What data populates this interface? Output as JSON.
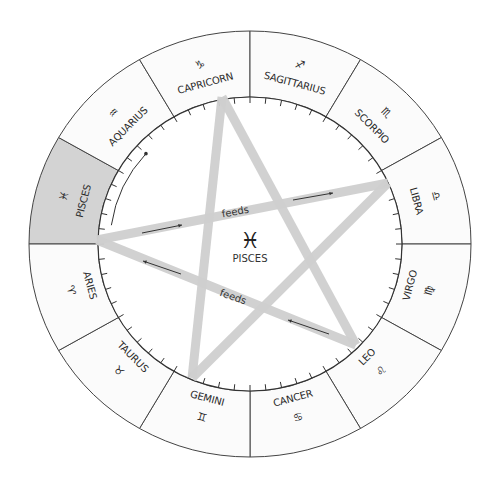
{
  "diagram": {
    "center": {
      "glyph": "♓",
      "label": "PISCES"
    },
    "highlight_color": "#d3d3d3",
    "line_color": "#cfcfcf",
    "signs": [
      {
        "name": "PISCES",
        "glyph": "♓",
        "start_deg": 150,
        "end_deg": 180,
        "highlighted": true
      },
      {
        "name": "AQUARIUS",
        "glyph": "♒",
        "start_deg": 120,
        "end_deg": 150,
        "highlighted": false
      },
      {
        "name": "CAPRICORN",
        "glyph": "♑",
        "start_deg": 90,
        "end_deg": 120,
        "highlighted": false
      },
      {
        "name": "SAGITTARIUS",
        "glyph": "♐",
        "start_deg": 60,
        "end_deg": 90,
        "highlighted": false
      },
      {
        "name": "SCORPIO",
        "glyph": "♏",
        "start_deg": 30,
        "end_deg": 60,
        "highlighted": false
      },
      {
        "name": "LIBRA",
        "glyph": "♎",
        "start_deg": 0,
        "end_deg": 30,
        "highlighted": false
      },
      {
        "name": "VIRGO",
        "glyph": "♍",
        "start_deg": -30,
        "end_deg": 0,
        "highlighted": false
      },
      {
        "name": "LEO",
        "glyph": "♌",
        "start_deg": -60,
        "end_deg": -30,
        "highlighted": false
      },
      {
        "name": "CANCER",
        "glyph": "♋",
        "start_deg": -90,
        "end_deg": -60,
        "highlighted": false
      },
      {
        "name": "GEMINI",
        "glyph": "♊",
        "start_deg": -120,
        "end_deg": -90,
        "highlighted": false
      },
      {
        "name": "TAURUS",
        "glyph": "♉",
        "start_deg": -150,
        "end_deg": -120,
        "highlighted": false
      },
      {
        "name": "ARIES",
        "glyph": "♈",
        "start_deg": -180,
        "end_deg": -150,
        "highlighted": false
      }
    ],
    "pentagram": {
      "vertices": {
        "left": [
          97,
          240
        ],
        "top": [
          222,
          97
        ],
        "right": [
          388,
          183
        ],
        "bottom_right": [
          356,
          345
        ],
        "bottom_left": [
          192,
          378
        ]
      },
      "edges": [
        {
          "from": "left",
          "to": "right",
          "label": "feeds",
          "arrow": "toward-right"
        },
        {
          "from": "left",
          "to": "bottom_right",
          "label": "feeds",
          "arrow": "toward-left"
        },
        {
          "from": "top",
          "to": "bottom_left",
          "label": "",
          "arrow": ""
        },
        {
          "from": "top",
          "to": "bottom_right",
          "label": "",
          "arrow": ""
        },
        {
          "from": "right",
          "to": "bottom_left",
          "label": "",
          "arrow": ""
        }
      ]
    },
    "labels": {
      "feeds_upper": "feeds",
      "feeds_lower": "feeds"
    }
  }
}
